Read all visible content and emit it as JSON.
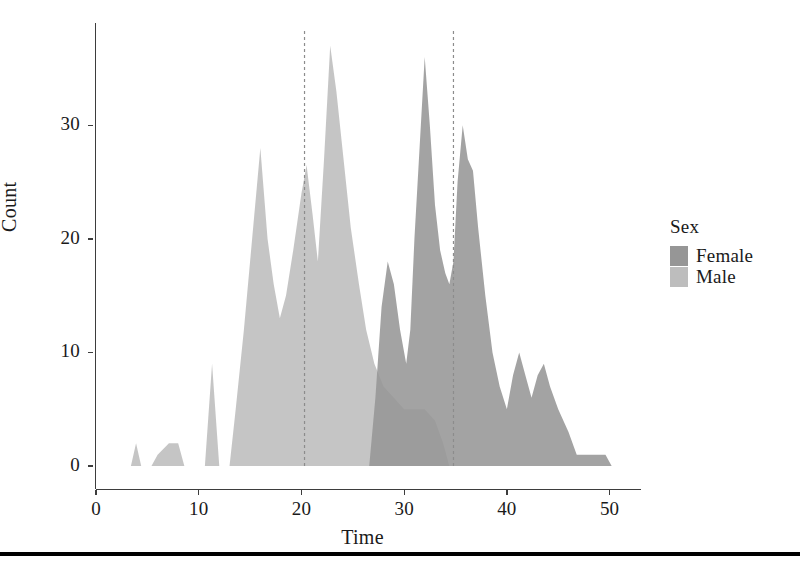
{
  "chart_data": {
    "type": "area",
    "title": "",
    "subtitle": "",
    "xlabel": "Time",
    "ylabel": "Count",
    "xlim": [
      0,
      51.5
    ],
    "ylim": [
      0,
      39
    ],
    "xticks": [
      0,
      10,
      20,
      30,
      40,
      50
    ],
    "yticks": [
      0,
      10,
      20,
      30
    ],
    "xtick_labels": [
      "0",
      "10",
      "20",
      "30",
      "40",
      "50"
    ],
    "ytick_labels": [
      "0",
      "10",
      "20",
      "30"
    ],
    "grid": false,
    "stacked": false,
    "legend": {
      "title": "Sex",
      "position": "right",
      "entries": [
        {
          "label": "Female",
          "color": "#969696"
        },
        {
          "label": "Male",
          "color": "#bdbdbd"
        }
      ]
    },
    "annotations": [
      {
        "type": "vline",
        "x": 20.3,
        "style": "dashed",
        "color": "#8c8c8c"
      },
      {
        "type": "vline",
        "x": 34.8,
        "style": "dashed",
        "color": "#8c8c8c"
      }
    ],
    "series": [
      {
        "name": "Male",
        "color": "#bdbdbd",
        "points": [
          [
            3.4,
            0
          ],
          [
            3.9,
            2
          ],
          [
            4.4,
            0
          ],
          [
            5.4,
            0
          ],
          [
            6.0,
            1
          ],
          [
            7.1,
            2
          ],
          [
            8.0,
            2
          ],
          [
            8.6,
            0
          ],
          [
            10.6,
            0
          ],
          [
            11.3,
            9
          ],
          [
            12.0,
            0
          ],
          [
            13.0,
            0
          ],
          [
            13.6,
            5
          ],
          [
            14.4,
            12
          ],
          [
            15.2,
            20
          ],
          [
            16.0,
            28
          ],
          [
            16.7,
            20
          ],
          [
            17.3,
            16
          ],
          [
            17.9,
            13
          ],
          [
            18.5,
            15
          ],
          [
            19.2,
            19
          ],
          [
            20.0,
            24
          ],
          [
            20.5,
            26.5
          ],
          [
            21.1,
            22
          ],
          [
            21.6,
            18
          ],
          [
            22.2,
            27
          ],
          [
            22.8,
            37
          ],
          [
            23.4,
            33
          ],
          [
            24.1,
            27
          ],
          [
            24.8,
            21
          ],
          [
            25.6,
            16
          ],
          [
            26.3,
            12
          ],
          [
            27.1,
            9
          ],
          [
            28.0,
            7
          ],
          [
            29.0,
            6
          ],
          [
            30.0,
            5
          ],
          [
            31.0,
            5
          ],
          [
            32.0,
            5
          ],
          [
            33.0,
            4
          ],
          [
            33.8,
            2
          ],
          [
            34.4,
            0
          ],
          [
            35.0,
            0
          ]
        ]
      },
      {
        "name": "Female",
        "color": "#969696",
        "points": [
          [
            26.6,
            0
          ],
          [
            27.2,
            6
          ],
          [
            27.8,
            14
          ],
          [
            28.4,
            18
          ],
          [
            29.0,
            16
          ],
          [
            29.6,
            12
          ],
          [
            30.2,
            9
          ],
          [
            30.6,
            12
          ],
          [
            31.0,
            20
          ],
          [
            31.5,
            28
          ],
          [
            32.0,
            36
          ],
          [
            32.5,
            30
          ],
          [
            33.0,
            23
          ],
          [
            33.5,
            19
          ],
          [
            34.0,
            17
          ],
          [
            34.4,
            16
          ],
          [
            34.8,
            18
          ],
          [
            35.2,
            25
          ],
          [
            35.7,
            30
          ],
          [
            36.2,
            27
          ],
          [
            36.7,
            26
          ],
          [
            37.2,
            21
          ],
          [
            37.9,
            15
          ],
          [
            38.6,
            10
          ],
          [
            39.3,
            7
          ],
          [
            40.0,
            5
          ],
          [
            40.6,
            8
          ],
          [
            41.2,
            10
          ],
          [
            41.8,
            8
          ],
          [
            42.4,
            6
          ],
          [
            43.0,
            8
          ],
          [
            43.6,
            9
          ],
          [
            44.2,
            7
          ],
          [
            45.0,
            5
          ],
          [
            46.0,
            3
          ],
          [
            46.8,
            1
          ],
          [
            48.0,
            1
          ],
          [
            49.6,
            1
          ],
          [
            50.2,
            0
          ]
        ]
      }
    ]
  },
  "axes": {
    "y_title": "Count",
    "x_title": "Time"
  }
}
